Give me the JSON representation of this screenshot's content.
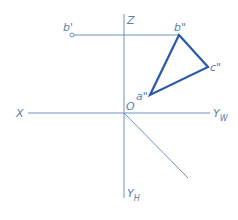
{
  "diagram": {
    "type": "orthographic projection (three-view)",
    "colors": {
      "axis": "#6d93be",
      "triangle": "#2a5aa6",
      "label": "#5a7fa8"
    },
    "axes": {
      "z_label": "Z",
      "x_label": "X",
      "yw_label": "Y",
      "yw_sub": "W",
      "yh_label": "Y",
      "yh_sub": "H",
      "origin_label": "O"
    },
    "points": {
      "b_prime": "b'",
      "b_double": "b\"",
      "c_double": "c\"",
      "a_double": "a\""
    }
  }
}
